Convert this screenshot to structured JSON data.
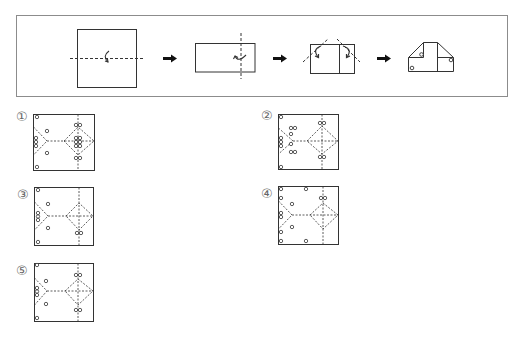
{
  "colors": {
    "line": "#333333",
    "frame": "#8c8c8c",
    "label": "#666666",
    "arrow": "#111111",
    "background": "#ffffff"
  },
  "question": {
    "steps": [
      {
        "name": "square-paper",
        "fold": "horizontal-dashed-fold-line",
        "fold_arrow": "curved-fold-arrow-up"
      },
      {
        "name": "half-rectangle",
        "fold": "vertical-dashed-fold-line",
        "fold_arrow": "curved-fold-arrow-back"
      },
      {
        "name": "folded-rectangle",
        "fold": "two-diagonal-corner-folds",
        "fold_arrow": "two-curved-fold-arrows"
      },
      {
        "name": "folded-shape-with-holes",
        "holes": [
          [
            421.5,
            54.5
          ],
          [
            451,
            60
          ],
          [
            412,
            68
          ]
        ]
      }
    ],
    "arrows": [
      "right-arrow-icon",
      "right-arrow-icon",
      "right-arrow-icon"
    ]
  },
  "options": [
    {
      "label": "①",
      "label_pos": {
        "x": 16,
        "y": 110
      },
      "box": {
        "x": 33,
        "y": 114,
        "w": 61,
        "h": 56
      },
      "creases": {
        "mid_y": 27,
        "apex_x": 14,
        "v_top": 13,
        "v_bottom": 41,
        "diamond_left": 31,
        "diamond_cx": 45,
        "diamond_top": 13,
        "diamond_bottom": 41
      },
      "holes": [
        [
          4,
          3
        ],
        [
          4,
          53
        ],
        [
          14,
          17
        ],
        [
          14,
          39
        ],
        [
          3,
          24
        ],
        [
          3,
          28
        ],
        [
          3,
          32
        ],
        [
          43,
          11
        ],
        [
          47,
          11
        ],
        [
          43,
          24
        ],
        [
          47,
          24
        ],
        [
          43,
          28
        ],
        [
          47,
          28
        ],
        [
          43,
          32
        ],
        [
          47,
          32
        ],
        [
          43,
          44
        ],
        [
          47,
          44
        ]
      ]
    },
    {
      "label": "②",
      "label_pos": {
        "x": 261,
        "y": 109
      },
      "box": {
        "x": 278,
        "y": 114,
        "w": 60,
        "h": 55
      },
      "creases": {
        "mid_y": 27,
        "apex_x": 15,
        "v_top": 14,
        "v_bottom": 40,
        "diamond_left": 29,
        "diamond_cx": 44,
        "diamond_top": 12,
        "diamond_bottom": 40
      },
      "holes": [
        [
          3,
          3
        ],
        [
          3,
          53
        ],
        [
          3,
          24
        ],
        [
          3,
          28
        ],
        [
          3,
          32
        ],
        [
          13,
          14
        ],
        [
          17,
          14
        ],
        [
          13,
          20
        ],
        [
          13,
          30
        ],
        [
          13,
          38
        ],
        [
          17,
          38
        ],
        [
          42,
          9
        ],
        [
          46,
          9
        ],
        [
          42,
          43
        ],
        [
          46,
          43
        ]
      ]
    },
    {
      "label": "③",
      "label_pos": {
        "x": 17,
        "y": 188
      },
      "box": {
        "x": 34,
        "y": 187,
        "w": 59,
        "h": 58
      },
      "creases": {
        "mid_y": 29,
        "apex_x": 14,
        "v_top": 15,
        "v_bottom": 43,
        "diamond_left": 32,
        "diamond_cx": 45,
        "diamond_top": 16,
        "diamond_bottom": 43
      },
      "holes": [
        [
          4,
          3
        ],
        [
          4,
          55
        ],
        [
          14,
          17
        ],
        [
          14,
          41
        ],
        [
          4,
          26
        ],
        [
          4,
          29.5
        ],
        [
          4,
          33
        ],
        [
          43,
          46
        ],
        [
          47,
          46
        ]
      ]
    },
    {
      "label": "④",
      "label_pos": {
        "x": 261,
        "y": 187
      },
      "box": {
        "x": 278,
        "y": 186,
        "w": 60,
        "h": 58
      },
      "creases": {
        "mid_y": 29,
        "apex_x": 14,
        "v_top": 15,
        "v_bottom": 43,
        "diamond_left": 32,
        "diamond_cx": 45,
        "diamond_top": 17,
        "diamond_bottom": 43
      },
      "holes": [
        [
          3,
          3
        ],
        [
          28,
          3
        ],
        [
          3,
          12
        ],
        [
          14,
          18
        ],
        [
          3,
          27
        ],
        [
          3,
          31
        ],
        [
          14,
          41
        ],
        [
          3,
          46
        ],
        [
          3,
          55
        ],
        [
          28,
          55
        ],
        [
          43,
          12
        ],
        [
          47,
          12
        ]
      ]
    },
    {
      "label": "⑤",
      "label_pos": {
        "x": 16,
        "y": 264
      },
      "box": {
        "x": 34,
        "y": 263,
        "w": 59,
        "h": 58
      },
      "creases": {
        "mid_y": 28,
        "apex_x": 13,
        "v_top": 15,
        "v_bottom": 42,
        "diamond_left": 31,
        "diamond_cx": 44,
        "diamond_top": 16,
        "diamond_bottom": 42
      },
      "holes": [
        [
          3,
          2
        ],
        [
          3,
          55
        ],
        [
          12,
          18
        ],
        [
          12,
          41
        ],
        [
          3,
          25
        ],
        [
          3,
          28.5
        ],
        [
          3,
          32
        ],
        [
          42,
          12
        ],
        [
          46,
          12
        ],
        [
          42,
          47
        ],
        [
          46,
          47
        ]
      ]
    }
  ]
}
